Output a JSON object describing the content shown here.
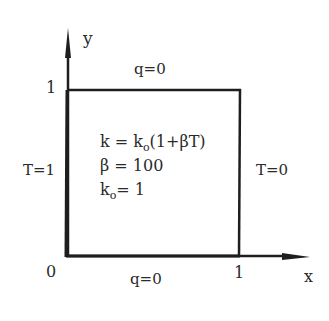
{
  "axes": {
    "x_label": "x",
    "y_label": "y",
    "origin_label": "0",
    "x_tick_label": "1",
    "y_tick_label": "1"
  },
  "boundaries": {
    "top": "q=0",
    "bottom": "q=0",
    "left": "T=1",
    "right": "T=0"
  },
  "equations": {
    "k_lhs": "k = k",
    "k_sub": "o",
    "k_rhs": "(1+βT)",
    "beta": "β = 100",
    "k0_base": "k",
    "k0_sub": "o",
    "k0_rhs": "= 1"
  },
  "colors": {
    "line": "#1e1e1e",
    "text": "#2a2a2a",
    "background": "#ffffff"
  }
}
